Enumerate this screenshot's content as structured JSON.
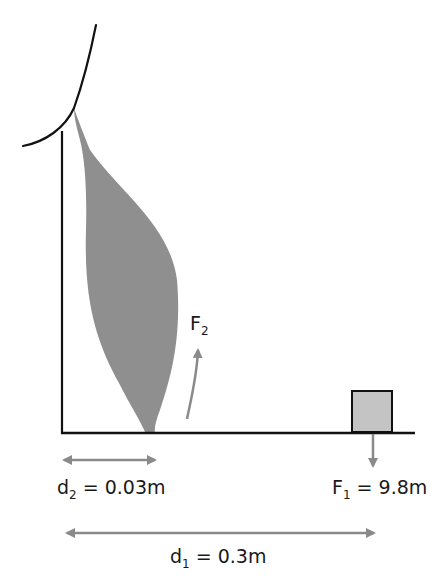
{
  "diagram": {
    "type": "biomechanics-lever",
    "colors": {
      "outline": "#111111",
      "muscle": "#8f8f8f",
      "box": "#c4c4c4",
      "arrow": "#8a8a8a",
      "text": "#1a1a1a"
    },
    "labels": {
      "f2": {
        "main": "F",
        "sub": "2",
        "rest": ""
      },
      "f1": {
        "main": "F",
        "sub": "1",
        "rest": " = 9.8m"
      },
      "d2": {
        "main": "d",
        "sub": "2",
        "rest": " = 0.03m"
      },
      "d1": {
        "main": "d",
        "sub": "1",
        "rest": " = 0.3m"
      }
    },
    "elements": [
      "upper-arm-outline",
      "humerus-line",
      "biceps-muscle",
      "forearm-line",
      "load-box",
      "force-arrow-f2",
      "force-arrow-f1",
      "distance-arrow-d2",
      "distance-arrow-d1"
    ]
  }
}
